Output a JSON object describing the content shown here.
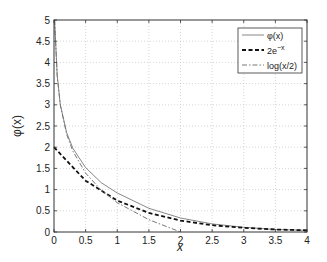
{
  "chart_data": {
    "type": "line",
    "title": "",
    "xlabel": "x",
    "ylabel": "φ(x)",
    "xlim": [
      0,
      4
    ],
    "ylim": [
      0,
      5
    ],
    "grid": true,
    "legend_position": "upper right",
    "xticks": [
      "0",
      "0.5",
      "1",
      "1.5",
      "2",
      "2.5",
      "3",
      "3.5",
      "4"
    ],
    "yticks": [
      "0",
      "0.5",
      "1",
      "1.5",
      "2",
      "2.5",
      "3",
      "3.5",
      "4",
      "4.5",
      "5"
    ],
    "series": [
      {
        "name": "φ(x)",
        "style": "solid",
        "color": "#888888",
        "x": [
          0.01,
          0.05,
          0.1,
          0.2,
          0.3,
          0.5,
          0.75,
          1,
          1.5,
          2,
          2.5,
          3,
          3.5,
          4
        ],
        "y": [
          5.0,
          3.69,
          3.0,
          2.34,
          1.97,
          1.52,
          1.16,
          0.92,
          0.56,
          0.33,
          0.19,
          0.11,
          0.06,
          0.04
        ]
      },
      {
        "name": "2e^{-x}",
        "style": "dashed",
        "color": "#111111",
        "x": [
          0,
          0.5,
          1,
          1.5,
          2,
          2.5,
          3,
          3.5,
          4
        ],
        "y": [
          2.0,
          1.21,
          0.74,
          0.45,
          0.27,
          0.16,
          0.1,
          0.06,
          0.04
        ]
      },
      {
        "name": "log(x/2)",
        "style": "dashdot",
        "color": "#777777",
        "x": [
          0.01,
          0.05,
          0.1,
          0.2,
          0.3,
          0.5,
          0.75,
          1,
          1.5,
          2
        ],
        "y": [
          5.0,
          3.69,
          3.0,
          2.3,
          1.9,
          1.39,
          0.98,
          0.69,
          0.29,
          0.0
        ]
      }
    ]
  },
  "legend": {
    "items": [
      "φ(x)",
      "2e",
      "log(x/2)"
    ],
    "exp_sup": "−x"
  },
  "axes": {
    "xlabel": "x",
    "ylabel": "φ(x)"
  }
}
